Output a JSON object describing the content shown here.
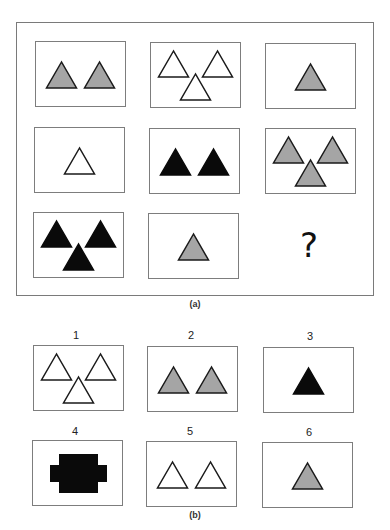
{
  "colors": {
    "grey": "#a5a5a5",
    "black": "#0a0a0a",
    "white": "#ffffff",
    "stroke": "#1a1a1a"
  },
  "matrix": {
    "caption": "(a)",
    "missing_label": "?",
    "cells": [
      {
        "row": 1,
        "col": 1,
        "count": 2,
        "fill": "grey"
      },
      {
        "row": 1,
        "col": 2,
        "count": 3,
        "fill": "white"
      },
      {
        "row": 1,
        "col": 3,
        "count": 1,
        "fill": "grey"
      },
      {
        "row": 2,
        "col": 1,
        "count": 1,
        "fill": "white"
      },
      {
        "row": 2,
        "col": 2,
        "count": 2,
        "fill": "black"
      },
      {
        "row": 2,
        "col": 3,
        "count": 3,
        "fill": "grey"
      },
      {
        "row": 3,
        "col": 1,
        "count": 3,
        "fill": "black"
      },
      {
        "row": 3,
        "col": 2,
        "count": 1,
        "fill": "grey"
      },
      {
        "row": 3,
        "col": 3,
        "count": 0,
        "fill": "missing"
      }
    ]
  },
  "options": {
    "caption": "(b)",
    "items": [
      {
        "label": "1",
        "count": 3,
        "fill": "white",
        "shape": "triangle"
      },
      {
        "label": "2",
        "count": 2,
        "fill": "grey",
        "shape": "triangle"
      },
      {
        "label": "3",
        "count": 1,
        "fill": "black",
        "shape": "triangle"
      },
      {
        "label": "4",
        "count": 1,
        "fill": "black",
        "shape": "blob"
      },
      {
        "label": "5",
        "count": 2,
        "fill": "white",
        "shape": "triangle"
      },
      {
        "label": "6",
        "count": 1,
        "fill": "grey",
        "shape": "triangle"
      }
    ]
  }
}
